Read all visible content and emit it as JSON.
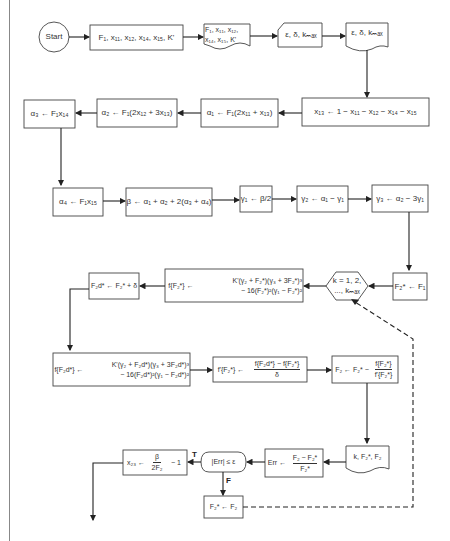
{
  "diagram": {
    "nodes": {
      "start": "Start",
      "input_params": "F₁, x₁₁, x₁₂, x₁₄, x₁₅, K'",
      "print_params_line1": "F₁, x₁₁, x₁₂,",
      "print_params_line2": "x₁₄, x₁₅, K'",
      "input_tol": "ε, δ, kₘₐₓ",
      "print_tol": "ε, δ, kₘₐₓ",
      "x13": "x₁₃ ← 1 − x₁₁ − x₁₂ − x₁₄ − x₁₅",
      "alpha1": "α₁ ← F₁(2x₁₁ + x₁₃)",
      "alpha2": "α₂ ← F₁(2x₁₂ + 3x₁₃)",
      "alpha3": "α₃ ← F₁x₁₄",
      "alpha4": "α₄ ← F₁x₁₅",
      "beta": "β ← α₁ + α₂ + 2(α₃ + α₄)",
      "gamma1": "γ₁ ← β/2",
      "gamma2": "γ₂ ← α₁ − γ₁",
      "gamma3": "γ₃ ← α₂ − 3γ₁",
      "init_f2": "F₂* ← F₁",
      "loop_line1": "k = 1, 2,",
      "loop_line2": "..., kₘₐₓ",
      "f_line1": "K'(γ₂ + F₂*)(γ₃ + 3F₂*)³",
      "f_line2": "− 16(F₂*)²(γ₁ − F₂*)²",
      "f_lhs": "f{F₂*} ←",
      "f2d": "F₂d* ← F₂* + δ",
      "fd_lhs": "f{F₂d*} ←",
      "fd_line1": "K'(γ₂ + F₂d*)(γ₃ + 3F₂d*)³",
      "fd_line2": "− 16(F₂d*)²(γ₁ − F₂d*)²",
      "fprime_lhs": "f'{F₂*} ←",
      "fprime_num": "f{F₂d*} − f{F₂*}",
      "fprime_den": "δ",
      "newton_lhs": "F₂ ← F₂* −",
      "newton_num": "f{F₂*}",
      "newton_den": "f'{F₂*}",
      "print_iter": "k, F₂*, F₂",
      "err_lhs": "Err ←",
      "err_num": "F₂ − F₂*",
      "err_den": "F₂*",
      "decision": "|Err| ≤ ε",
      "x23_lhs": "x₂₃ ←",
      "x23_num": "β",
      "x23_den": "2F₂",
      "x23_tail": "− 1",
      "update": "F₂* ← F₂"
    },
    "edge_labels": {
      "true": "T",
      "false": "F"
    },
    "colors": {
      "line": "#222222",
      "border": "#444444",
      "background": "#ffffff"
    }
  }
}
